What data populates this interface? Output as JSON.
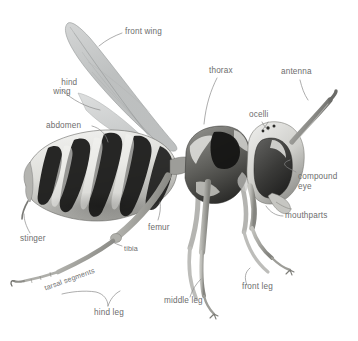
{
  "diagram": {
    "view": "lateral",
    "background_color": "#ffffff",
    "label_color": "#6d6d6d",
    "leader_line_color": "#8a8a8a",
    "body_colors": {
      "dark": "#1a1a1a",
      "mid": "#6f6f6f",
      "light": "#d8d8d6",
      "pale": "#efefed",
      "wing": "#b9bbbb",
      "leg": "#a9a9a5"
    }
  },
  "labels": [
    {
      "id": "front-wing",
      "text": "front wing",
      "x": 125,
      "y": 27,
      "align": "left"
    },
    {
      "id": "hind-wing",
      "text": "hind\nwing",
      "x": 46,
      "y": 68,
      "align": "center"
    },
    {
      "id": "thorax",
      "text": "thorax",
      "x": 209,
      "y": 66,
      "align": "left"
    },
    {
      "id": "antenna",
      "text": "antenna",
      "x": 281,
      "y": 67,
      "align": "left"
    },
    {
      "id": "ocelli",
      "text": "ocelli",
      "x": 249,
      "y": 110,
      "align": "left"
    },
    {
      "id": "abdomen",
      "text": "abdomen",
      "x": 46,
      "y": 121,
      "align": "left"
    },
    {
      "id": "compound-eye",
      "text": "compound\neye",
      "x": 298,
      "y": 172,
      "align": "left"
    },
    {
      "id": "mouthparts",
      "text": "mouthparts",
      "x": 285,
      "y": 211,
      "align": "left"
    },
    {
      "id": "femur",
      "text": "femur",
      "x": 148,
      "y": 223,
      "align": "left"
    },
    {
      "id": "stinger",
      "text": "stinger",
      "x": 20,
      "y": 234,
      "align": "left"
    },
    {
      "id": "tibia",
      "text": "tibia",
      "x": 124,
      "y": 244,
      "align": "left"
    },
    {
      "id": "tarsal-segments",
      "text": "tarsal segments",
      "x": 43,
      "y": 284,
      "align": "rot"
    },
    {
      "id": "front-leg",
      "text": "front leg",
      "x": 242,
      "y": 282,
      "align": "left"
    },
    {
      "id": "middle-leg",
      "text": "middle leg",
      "x": 164,
      "y": 296,
      "align": "left"
    },
    {
      "id": "hind-leg",
      "text": "hind leg",
      "x": 94,
      "y": 308,
      "align": "left"
    }
  ]
}
